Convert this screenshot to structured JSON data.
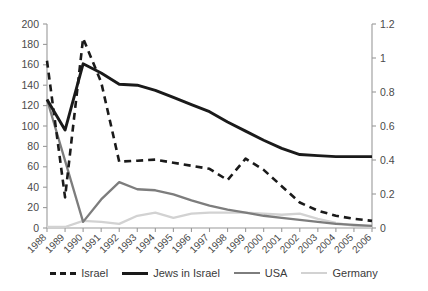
{
  "chart_data": {
    "type": "line",
    "title": "",
    "subtitle": "",
    "xlabel": "",
    "ylabel": "",
    "y2label": "",
    "grid": false,
    "legend_position": "bottom",
    "categories": [
      "1988",
      "1989",
      "1990",
      "1991",
      "1992",
      "1993",
      "1994",
      "1995",
      "1996",
      "1997",
      "1998",
      "1999",
      "2000",
      "2001",
      "2002",
      "2003",
      "2004",
      "2005",
      "2006"
    ],
    "x": [
      1988,
      1989,
      1990,
      1991,
      1992,
      1993,
      1994,
      1995,
      1996,
      1997,
      1998,
      1999,
      2000,
      2001,
      2002,
      2003,
      2004,
      2005,
      2006
    ],
    "ylim": [
      0,
      200
    ],
    "yticks": [
      0,
      20,
      40,
      60,
      80,
      100,
      120,
      140,
      160,
      180,
      200
    ],
    "y2lim": [
      0,
      1.2
    ],
    "y2ticks": [
      0,
      0.2,
      0.4,
      0.6,
      0.8,
      1,
      1.2
    ],
    "ytick_labels": [
      "0",
      "20",
      "40",
      "60",
      "80",
      "100",
      "120",
      "140",
      "160",
      "180",
      "200"
    ],
    "y2tick_labels": [
      "0",
      "0.2",
      "0.4",
      "0.6",
      "0.8",
      "1",
      "1.2"
    ],
    "series": [
      {
        "name": "Israel",
        "axis": "left",
        "style": "dashed",
        "color": "#1a1a1a",
        "width": 2.6,
        "values": [
          164,
          30,
          186,
          143,
          65,
          66,
          67,
          64,
          61,
          58,
          47,
          68,
          57,
          41,
          25,
          17,
          12,
          9,
          7
        ]
      },
      {
        "name": "Jews in Israel",
        "axis": "left",
        "style": "solid",
        "color": "#1a1a1a",
        "width": 2.9,
        "values": [
          126,
          96,
          161,
          152,
          141,
          140,
          135,
          128,
          121,
          114,
          104,
          95,
          86,
          78,
          72,
          71,
          70,
          70,
          70
        ]
      },
      {
        "name": "USA",
        "axis": "left",
        "style": "solid",
        "color": "#7d7d7d",
        "width": 2.3,
        "values": [
          126,
          66,
          6,
          28,
          45,
          38,
          37,
          33,
          27,
          22,
          18,
          15,
          12,
          10,
          8,
          6,
          4,
          3,
          2
        ]
      },
      {
        "name": "Germany",
        "axis": "left",
        "style": "solid",
        "color": "#d2d2d2",
        "width": 2.3,
        "values": [
          1,
          1,
          7,
          6,
          4,
          12,
          15,
          10,
          14,
          15,
          15,
          15,
          14,
          13,
          14,
          9,
          5,
          2,
          1
        ]
      }
    ],
    "annotations": []
  },
  "legend": {
    "items": [
      {
        "label": "Israel",
        "color": "#1a1a1a",
        "style": "dashed",
        "width": 3
      },
      {
        "label": "Jews in Israel",
        "color": "#1a1a1a",
        "style": "solid",
        "width": 3
      },
      {
        "label": "USA",
        "color": "#7d7d7d",
        "style": "solid",
        "width": 2.5
      },
      {
        "label": "Germany",
        "color": "#d2d2d2",
        "style": "solid",
        "width": 2.5
      }
    ]
  }
}
